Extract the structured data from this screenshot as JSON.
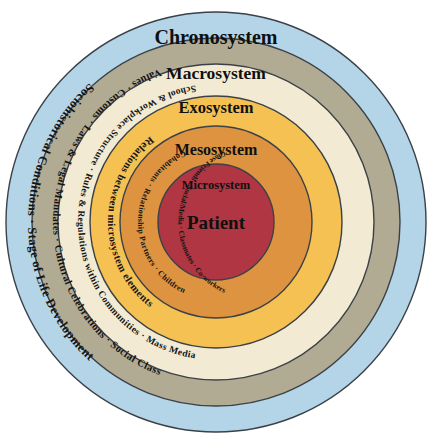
{
  "diagram": {
    "background_color": "#ffffff",
    "center": {
      "x": 216,
      "y": 222
    }
  },
  "chart_data": {
    "type": "pie",
    "layout": "concentric-rings",
    "legend": "none",
    "categories": [
      "Chronosystem",
      "Macrosystem",
      "Exosystem",
      "Mesosystem",
      "Microsystem",
      "Patient"
    ],
    "values": [
      210,
      184,
      158,
      126,
      96,
      58
    ],
    "ylabel": "outer radius (px)",
    "xlabel": "system level",
    "series": [
      {
        "name": "outer_radius_px",
        "values": [
          210,
          184,
          158,
          126,
          96,
          58
        ]
      }
    ]
  },
  "rings": [
    {
      "id": "chronosystem",
      "label": "Chronosystem",
      "outer_radius": 210,
      "fill": "#b4d4e8",
      "stroke": "#3b4148",
      "label_y": 44,
      "label_size": 20,
      "arc_text": "Sociohistorical Conditions · Stage of Life Development",
      "arc_radius": 188,
      "arc_size": 12.5
    },
    {
      "id": "macrosystem",
      "label": "Macrosystem",
      "outer_radius": 184,
      "fill": "#b2ab93",
      "stroke": "#3b4148",
      "label_y": 79,
      "label_size": 17.5,
      "arc_text": "Values · Customs · Laws & Legal Mandates · Cultural Celebrations · Social Class",
      "arc_radius": 163,
      "arc_size": 10.5
    },
    {
      "id": "exosystem",
      "label": "Exosystem",
      "outer_radius": 158,
      "fill": "#f2ead2",
      "stroke": "#3b4148",
      "label_y": 113,
      "label_size": 16.5,
      "arc_text": "School & Workplace Structure · Rules & Regulations within Communities · Mass Media",
      "arc_radius": 138,
      "arc_size": 9.5
    },
    {
      "id": "mesosystem",
      "label": "Mesosystem",
      "outer_radius": 126,
      "fill": "#f5c153",
      "stroke": "#3b4148",
      "label_y": 155,
      "label_size": 16,
      "arc_text": "Relations between microsystem elements",
      "arc_radius": 108,
      "arc_size": 10.5
    },
    {
      "id": "microsystem",
      "label": "Microsystem",
      "outer_radius": 96,
      "fill": "#dd9340",
      "stroke": "#3b4148",
      "label_y": 189,
      "label_size": 12.5,
      "arc_text": "Cohabitants · Relationship Partners · Children",
      "arc_radius": 78,
      "arc_size": 8,
      "arc_text_2": "Close Friends · Social/Media · Classmates · Co-workers",
      "arc_radius_2": 78,
      "arc_size_2": 7.5
    },
    {
      "id": "patient",
      "label": "Patient",
      "outer_radius": 58,
      "fill": "#af3642",
      "stroke": "#3b4148",
      "label_y": 229,
      "label_size": 19
    }
  ]
}
